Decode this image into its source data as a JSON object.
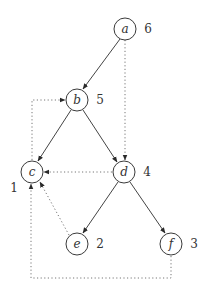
{
  "diagram": {
    "type": "directed-graph",
    "nodes": [
      {
        "id": "a",
        "label": "a",
        "order": "6",
        "x": 125,
        "y": 29
      },
      {
        "id": "b",
        "label": "b",
        "order": "5",
        "x": 77,
        "y": 100
      },
      {
        "id": "c",
        "label": "c",
        "order": "1",
        "x": 32,
        "y": 172
      },
      {
        "id": "d",
        "label": "d",
        "order": "4",
        "x": 124,
        "y": 172
      },
      {
        "id": "e",
        "label": "e",
        "order": "2",
        "x": 77,
        "y": 244
      },
      {
        "id": "f",
        "label": "f",
        "order": "3",
        "x": 171,
        "y": 244
      }
    ],
    "tree_edges": [
      {
        "from": "a",
        "to": "b",
        "style": "solid"
      },
      {
        "from": "b",
        "to": "c",
        "style": "solid"
      },
      {
        "from": "b",
        "to": "d",
        "style": "solid"
      },
      {
        "from": "d",
        "to": "e",
        "style": "solid"
      },
      {
        "from": "d",
        "to": "f",
        "style": "solid"
      }
    ],
    "non_tree_edges": [
      {
        "from": "a",
        "to": "d",
        "style": "dotted"
      },
      {
        "from": "c",
        "to": "b",
        "style": "dotted",
        "route": "up-then-right"
      },
      {
        "from": "d",
        "to": "c",
        "style": "dotted"
      },
      {
        "from": "e",
        "to": "c",
        "style": "dotted"
      },
      {
        "from": "f",
        "to": "c",
        "style": "dotted",
        "route": "down-left-up"
      }
    ]
  }
}
